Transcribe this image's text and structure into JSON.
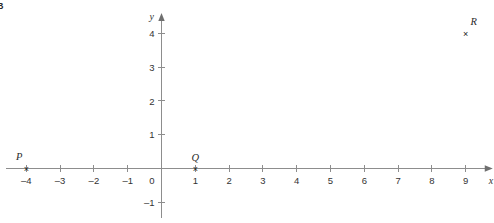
{
  "problem": {
    "label": "B"
  },
  "chart_data": {
    "type": "scatter",
    "title": "",
    "xlabel": "x",
    "ylabel": "y",
    "grid": false,
    "legend": null,
    "xlim": [
      -4.6,
      9.8
    ],
    "ylim": [
      -1.45,
      4.6
    ],
    "x_ticks": [
      -4,
      -3,
      -2,
      -1,
      0,
      1,
      2,
      3,
      4,
      5,
      6,
      7,
      8,
      9
    ],
    "x_tick_labels": [
      "–4",
      "–3",
      "–2",
      "–1",
      "0",
      "1",
      "2",
      "3",
      "4",
      "5",
      "6",
      "7",
      "8",
      "9"
    ],
    "y_ticks": [
      -1,
      1,
      2,
      3,
      4
    ],
    "y_tick_labels": [
      "–1",
      "1",
      "2",
      "3",
      "4"
    ],
    "marker": "×",
    "points": [
      {
        "name": "P",
        "x": -4,
        "y": 0,
        "label": "P",
        "label_pos": "above-left"
      },
      {
        "name": "Q",
        "x": 1,
        "y": 0,
        "label": "Q",
        "label_pos": "above"
      },
      {
        "name": "R",
        "x": 9,
        "y": 4,
        "label": "R",
        "label_pos": "above-right"
      }
    ]
  }
}
